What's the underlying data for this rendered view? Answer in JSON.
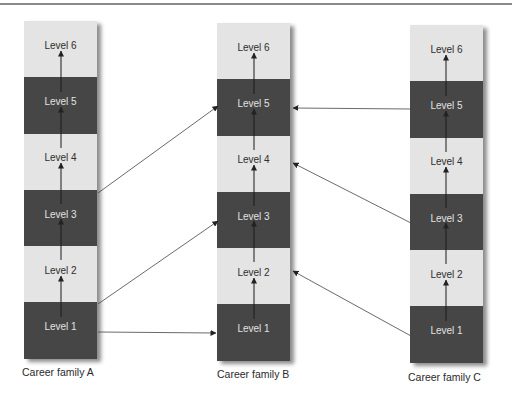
{
  "diagram": {
    "type": "career-lattice",
    "colors": {
      "dark_block": "#464646",
      "light_block": "#e4e4e4",
      "arrow": "#333333"
    },
    "columns": [
      {
        "id": "A",
        "label": "Career family A",
        "levels": [
          "Level 6",
          "Level 5",
          "Level 4",
          "Level 3",
          "Level 2",
          "Level 1"
        ]
      },
      {
        "id": "B",
        "label": "Career family B",
        "levels": [
          "Level 6",
          "Level 5",
          "Level 4",
          "Level 3",
          "Level 2",
          "Level 1"
        ]
      },
      {
        "id": "C",
        "label": "Career family C",
        "levels": [
          "Level 6",
          "Level 5",
          "Level 4",
          "Level 3",
          "Level 2",
          "Level 1"
        ]
      }
    ],
    "cross_arrows": [
      {
        "from": "A Level 3",
        "to": "B Level 5"
      },
      {
        "from": "A Level 2",
        "to": "B Level 3"
      },
      {
        "from": "A Level 1",
        "to": "B Level 1"
      },
      {
        "from": "C Level 5",
        "to": "B Level 5"
      },
      {
        "from": "C Level 3",
        "to": "B Level 4"
      },
      {
        "from": "C Level 1",
        "to": "B Level 2"
      }
    ]
  }
}
